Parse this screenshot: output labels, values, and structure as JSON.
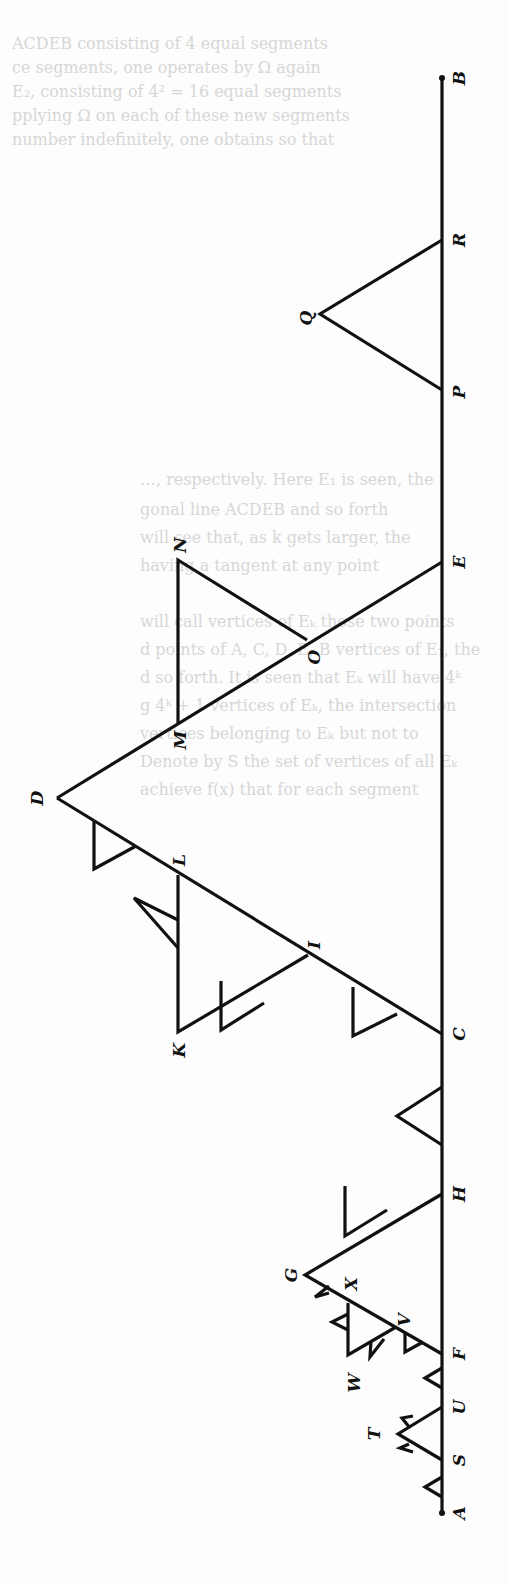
{
  "figure": {
    "orientation": "rotated-90-ccw",
    "stroke_color": "#111111",
    "background": "#fdfdfd",
    "baseline": {
      "from": "A",
      "to": "B"
    },
    "labels": {
      "A": "A",
      "S": "S",
      "T": "T",
      "U": "U",
      "F": "F",
      "W": "W",
      "V": "V",
      "X": "X",
      "G": "G",
      "H": "H",
      "C": "C",
      "K": "K",
      "I": "I",
      "L": "L",
      "D": "D",
      "M": "M",
      "O": "O",
      "N": "N",
      "E": "E",
      "P": "P",
      "Q": "Q",
      "R": "R",
      "B": "B"
    }
  },
  "bleed_through": {
    "lines": [
      "ACDEB consisting of 4 equal segments",
      "ce segments, one operates by Ω again",
      "E₂, consisting of 4² = 16 equal segments",
      "pplying Ω on each of these new segments",
      "number indefinitely, one obtains so that",
      "…, respectively. Here E₁ is seen, the",
      "gonal line ACDEB and so forth",
      "will see that, as k gets larger, the",
      "having a tangent at any point",
      "will call vertices of Eₖ those two points",
      "d points of A, C, D, E, B vertices of E₁, the",
      "d so forth. It is seen that Eₖ will have 4ᵏ",
      "g 4ᵏ + 1 vertices of Eₖ, the intersection",
      "vertices belonging to Eₖ but not to",
      "Denote by S the set of vertices of all Eₖ",
      "achieve f(x) that for each segment"
    ]
  }
}
